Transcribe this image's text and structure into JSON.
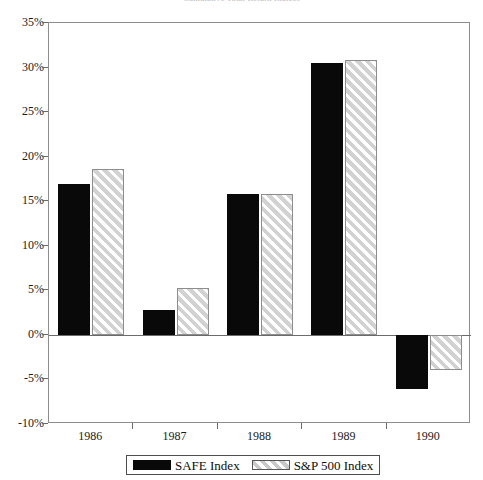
{
  "chart_data": {
    "type": "bar",
    "title": "Cumulative Total Return Indices",
    "xlabel": "",
    "ylabel": "",
    "categories": [
      "1986",
      "1987",
      "1988",
      "1989",
      "1990"
    ],
    "series": [
      {
        "name": "SAFE Index",
        "values": [
          16.9,
          2.8,
          15.8,
          30.5,
          -6.1
        ],
        "color": "#090909",
        "fill": "solid"
      },
      {
        "name": "S&P 500 Index",
        "values": [
          18.6,
          5.3,
          15.8,
          30.9,
          -3.9
        ],
        "color": "#d2d2d2",
        "fill": "diagonal-hatch"
      }
    ],
    "ylim": [
      -10,
      35
    ],
    "ytick_values": [
      35,
      30,
      25,
      20,
      15,
      10,
      5,
      0,
      -5,
      -10
    ],
    "ytick_labels": [
      "35%",
      "30%",
      "25%",
      "20%",
      "15%",
      "10%",
      "5%",
      "0%",
      "-5%",
      "-10%"
    ],
    "grid": false,
    "legend_position": "bottom-center",
    "zero_line": true
  },
  "legend": {
    "entries": [
      {
        "label": "SAFE Index"
      },
      {
        "label": "S&P 500 Index"
      }
    ]
  }
}
